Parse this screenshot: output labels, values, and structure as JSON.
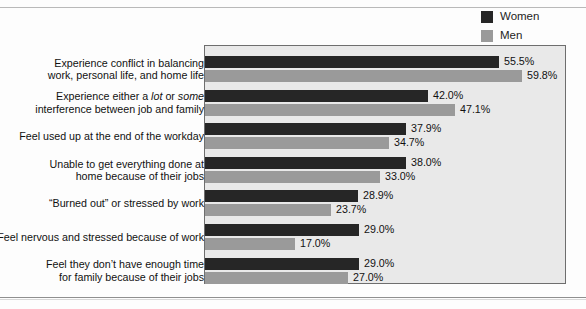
{
  "legend": {
    "items": [
      {
        "label": "Women",
        "color": "#262626",
        "name": "legend-women"
      },
      {
        "label": "Men",
        "color": "#9a9a9a",
        "name": "legend-men"
      }
    ]
  },
  "chart_data": {
    "type": "bar",
    "orientation": "horizontal",
    "title": "",
    "subtitle": "",
    "xlabel": "",
    "ylabel": "",
    "grid": false,
    "legend_position": "top-right",
    "value_suffix": "%",
    "xlim": [
      0,
      68
    ],
    "plot_background": "#e9e9e9",
    "categories": [
      "Experience conflict in balancing\nwork, personal life, and home life",
      "Experience either a lot or some\ninterference between job and family",
      "Feel used up at the end of the workday",
      "Unable to get everything done at\nhome because of their jobs",
      "“Burned out” or stressed by work",
      "Feel nervous and stressed because of work",
      "Feel they don’t have enough time\nfor family because of their jobs"
    ],
    "series": [
      {
        "name": "Women",
        "color": "#262626",
        "values": [
          55.5,
          42.0,
          37.9,
          38.0,
          28.9,
          29.0,
          29.0
        ],
        "labels": [
          "55.5%",
          "42.0%",
          "37.9%",
          "38.0%",
          "28.9%",
          "29.0%",
          "29.0%"
        ]
      },
      {
        "name": "Men",
        "color": "#9a9a9a",
        "values": [
          59.8,
          47.1,
          34.7,
          33.0,
          23.7,
          17.0,
          27.0
        ],
        "labels": [
          "59.8%",
          "47.1%",
          "34.7%",
          "33.0%",
          "23.7%",
          "17.0%",
          "27.0%"
        ]
      }
    ]
  },
  "rows": [
    {
      "label_html": "Experience conflict in balancing<br>work, personal life, and home life",
      "label_plain": "Experience conflict in balancing work, personal life, and home life"
    },
    {
      "label_html": "Experience either a <em>lot</em> or <em>some</em><br>interference between job and family",
      "label_plain": "Experience either a lot or some interference between job and family"
    },
    {
      "label_html": "Feel used up at the end of the workday",
      "label_plain": "Feel used up at the end of the workday"
    },
    {
      "label_html": "Unable to get everything done at<br>home because of their jobs",
      "label_plain": "Unable to get everything done at home because of their jobs"
    },
    {
      "label_html": "&ldquo;Burned out&rdquo; or stressed by work",
      "label_plain": "“Burned out” or stressed by work"
    },
    {
      "label_html": "Feel nervous and stressed because of work",
      "label_plain": "Feel nervous and stressed because of work"
    },
    {
      "label_html": "Feel they don&rsquo;t have enough time<br>for family because of their jobs",
      "label_plain": "Feel they don’t have enough time for family because of their jobs"
    }
  ]
}
